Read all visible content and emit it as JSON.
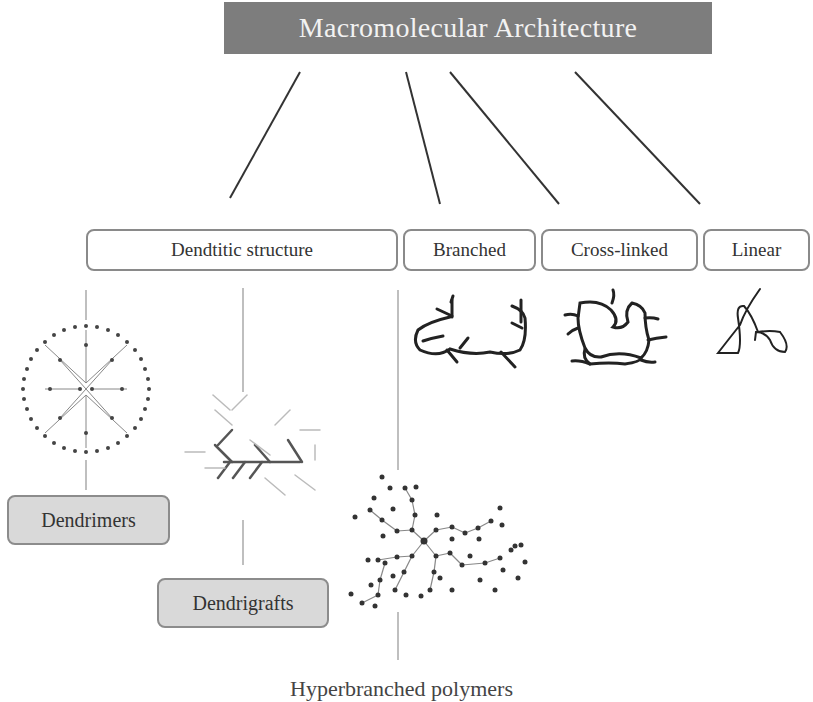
{
  "title": "Macromolecular Architecture",
  "categories": [
    {
      "id": "dendritic",
      "label": "Dendtitic structure"
    },
    {
      "id": "branched",
      "label": "Branched"
    },
    {
      "id": "cross-linked",
      "label": "Cross-linked"
    },
    {
      "id": "linear",
      "label": "Linear"
    }
  ],
  "dendritic_subtypes": [
    {
      "id": "dendrimers",
      "label": "Dendrimers"
    },
    {
      "id": "dendrigrafts",
      "label": "Dendrigrafts"
    },
    {
      "id": "hyperbranched",
      "label": "Hyperbranched polymers"
    }
  ],
  "colors": {
    "title_bg": "#7d7d7d",
    "title_text": "#f2f2f2",
    "box_border": "#8a8a8a",
    "leaf_bg": "#d9d9d9",
    "line": "#333333"
  }
}
